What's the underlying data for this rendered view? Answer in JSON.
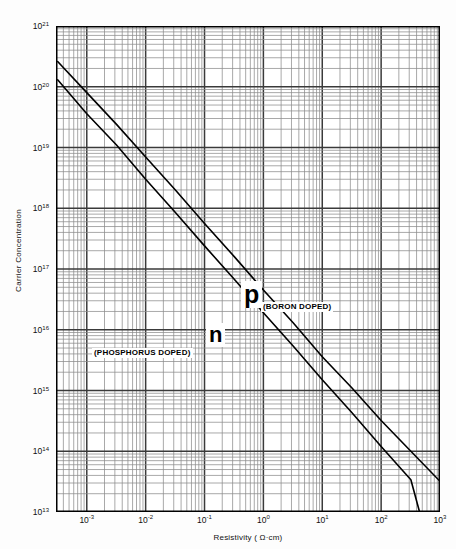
{
  "chart_data": {
    "type": "line",
    "title": "",
    "xlabel": "Resistivity ( Ω·cm)",
    "ylabel": "Carrier  Concentration",
    "xscale": "log",
    "yscale": "log",
    "xlim": [
      0.0003,
      1000
    ],
    "ylim": [
      10000000000000.0,
      1e+21
    ],
    "grid": true,
    "legend_position": "inline-annotations",
    "x_tick_labels": [
      "10−3",
      "10−2",
      "10−1",
      "10⁰",
      "10¹",
      "10²",
      "10³"
    ],
    "x_tick_values": [
      0.001,
      0.01,
      0.1,
      1,
      10,
      100,
      1000
    ],
    "y_tick_labels": [
      "10²¹",
      "10²⁰",
      "10¹⁹",
      "10¹⁸",
      "10¹⁷",
      "10¹⁶",
      "10¹⁵",
      "10¹⁴",
      "10¹³"
    ],
    "y_tick_values": [
      1e+21,
      1e+20,
      1e+19,
      1e+18,
      1e+17,
      1e+16,
      1000000000000000.0,
      100000000000000.0,
      10000000000000.0
    ],
    "series": [
      {
        "name": "p",
        "annotation": "(BORON DOPED)",
        "dopant": "BORON DOPED",
        "color": "#000000",
        "points": [
          [
            0.00032,
            2.6e+20
          ],
          [
            0.001,
            8e+19
          ],
          [
            0.0032,
            2.4e+19
          ],
          [
            0.01,
            7e+18
          ],
          [
            0.032,
            2e+18
          ],
          [
            0.1,
            5.6e+17
          ],
          [
            0.32,
            1.6e+17
          ],
          [
            1.0,
            4.5e+16
          ],
          [
            3.2,
            1.3e+16
          ],
          [
            10.0,
            3600000000000000.0
          ],
          [
            32.0,
            1100000000000000.0
          ],
          [
            100.0,
            320000000000000.0
          ],
          [
            320.0,
            100000000000000.0
          ],
          [
            1000.0,
            32000000000000.0
          ]
        ]
      },
      {
        "name": "n",
        "annotation": "(PHOSPHORUS DOPED)",
        "dopant": "PHOSPHORUS DOPED",
        "color": "#000000",
        "points": [
          [
            0.00032,
            1.3e+20
          ],
          [
            0.001,
            3.6e+19
          ],
          [
            0.0032,
            1.1e+19
          ],
          [
            0.01,
            3e+18
          ],
          [
            0.032,
            8.5e+17
          ],
          [
            0.1,
            2.4e+17
          ],
          [
            0.32,
            6.8e+16
          ],
          [
            1.0,
            1.9e+16
          ],
          [
            3.2,
            5400000000000000.0
          ],
          [
            10.0,
            1500000000000000.0
          ],
          [
            32.0,
            430000000000000.0
          ],
          [
            100.0,
            120000000000000.0
          ],
          [
            320.0,
            34000000000000.0
          ],
          [
            450.0,
            10000000000000.0
          ]
        ]
      }
    ]
  },
  "axes": {
    "y_title": "Carrier  Concentration",
    "x_title": "Resistivity ( Ω·cm)",
    "y_ticks": [
      {
        "label_base": "10",
        "label_exp": "21",
        "value": 1e+21
      },
      {
        "label_base": "10",
        "label_exp": "20",
        "value": 1e+20
      },
      {
        "label_base": "10",
        "label_exp": "19",
        "value": 1e+19
      },
      {
        "label_base": "10",
        "label_exp": "18",
        "value": 1e+18
      },
      {
        "label_base": "10",
        "label_exp": "17",
        "value": 1e+17
      },
      {
        "label_base": "10",
        "label_exp": "16",
        "value": 1e+16
      },
      {
        "label_base": "10",
        "label_exp": "15",
        "value": 1000000000000000.0
      },
      {
        "label_base": "10",
        "label_exp": "14",
        "value": 100000000000000.0
      },
      {
        "label_base": "10",
        "label_exp": "13",
        "value": 10000000000000.0
      }
    ],
    "x_ticks": [
      {
        "label_base": "10",
        "label_exp": "-3",
        "value": 0.001
      },
      {
        "label_base": "10",
        "label_exp": "-2",
        "value": 0.01
      },
      {
        "label_base": "10",
        "label_exp": "-1",
        "value": 0.1
      },
      {
        "label_base": "10",
        "label_exp": "0",
        "value": 1
      },
      {
        "label_base": "10",
        "label_exp": "1",
        "value": 10
      },
      {
        "label_base": "10",
        "label_exp": "2",
        "value": 100
      },
      {
        "label_base": "10",
        "label_exp": "3",
        "value": 1000
      }
    ]
  },
  "annotations": {
    "p_letter": "p",
    "p_sub": "(BORON DOPED)",
    "n_letter": "n",
    "n_sub": "(PHOSPHORUS DOPED)"
  },
  "style": {
    "curve_color": "#000000",
    "major_grid_color": "#3a3a3a",
    "minor_grid_color": "#8c8c8c",
    "frame_color": "#000000",
    "background": "#ffffff"
  }
}
